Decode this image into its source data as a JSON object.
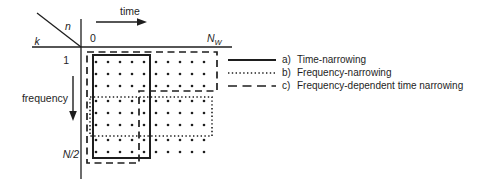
{
  "figure": {
    "background": "#ffffff",
    "ink_color": "#1e1e1e"
  },
  "axes": {
    "horizontal_var": "n",
    "vertical_var": "k",
    "time_label": "time",
    "frequency_label": "frequency",
    "origin_label": "0",
    "time_end_base": "N",
    "time_end_sub": "W",
    "freq_first_label": "1",
    "freq_last_label": "N/2"
  },
  "grid": {
    "dot_columns_x": [
      96,
      108,
      120,
      132,
      144,
      156,
      168,
      180,
      192,
      204
    ],
    "dot_rows_y": [
      62,
      74,
      86,
      101,
      113,
      125,
      140,
      152
    ]
  },
  "regions": {
    "a_style": "solid",
    "b_style": "dotted",
    "c_style": "dashed"
  },
  "legend": {
    "items": [
      {
        "prefix": "a)",
        "label": "Time-narrowing",
        "style": "solid"
      },
      {
        "prefix": "b)",
        "label": "Frequency-narrowing",
        "style": "dotted"
      },
      {
        "prefix": "c)",
        "label": "Frequency-dependent time narrowing",
        "style": "dashed"
      }
    ]
  }
}
